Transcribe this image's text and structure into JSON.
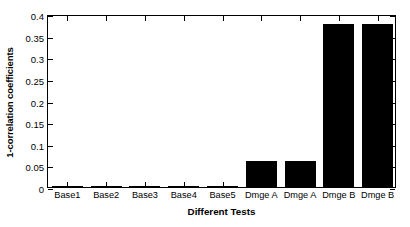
{
  "chart_data": {
    "type": "bar",
    "title": "",
    "xlabel": "Different Tests",
    "ylabel": "1-correlation coefficients",
    "categories": [
      "Base1",
      "Base2",
      "Base3",
      "Base4",
      "Base5",
      "Dmge A",
      "Dmge A",
      "Dmge B",
      "Dmge B"
    ],
    "values": [
      0.001,
      0.003,
      0.002,
      0.003,
      0.002,
      0.06,
      0.059,
      0.377,
      0.376
    ],
    "ylim": [
      0,
      0.4
    ],
    "ytick_labels": [
      "0",
      "0.05",
      "0.1",
      "0.15",
      "0.2",
      "0.25",
      "0.3",
      "0.35",
      "0.4"
    ],
    "ytick_values": [
      0,
      0.05,
      0.1,
      0.15,
      0.2,
      0.25,
      0.3,
      0.35,
      0.4
    ],
    "grid": false,
    "legend": null,
    "bar_color": "#000000",
    "axis_color": "#000000",
    "background": "#ffffff"
  }
}
